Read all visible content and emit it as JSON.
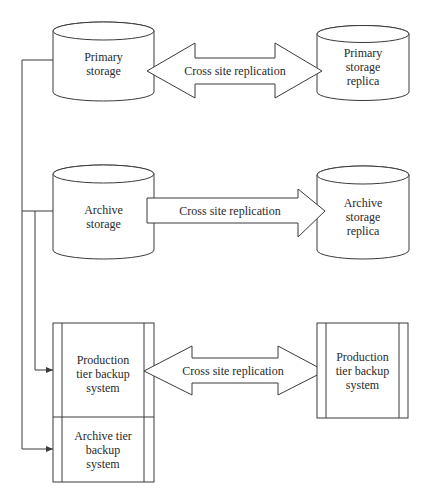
{
  "diagram": {
    "nodes": {
      "primary_storage": {
        "label": "Primary\nstorage",
        "shape": "cylinder"
      },
      "primary_storage_replica": {
        "label": "Primary\nstorage\nreplica",
        "shape": "cylinder"
      },
      "archive_storage": {
        "label": "Archive\nstorage",
        "shape": "cylinder"
      },
      "archive_storage_replica": {
        "label": "Archive\nstorage\nreplica",
        "shape": "cylinder"
      },
      "production_tier_backup": {
        "label": "Production\ntier backup\nsystem",
        "shape": "box"
      },
      "archive_tier_backup": {
        "label": "Archive tier\nbackup\nsystem",
        "shape": "box"
      },
      "production_tier_backup_replica": {
        "label": "Production\ntier backup\nsystem",
        "shape": "box"
      }
    },
    "arrows": {
      "primary_replication": {
        "label": "Cross site replication",
        "direction": "bidirectional"
      },
      "archive_replication": {
        "label": "Cross site replication",
        "direction": "one-way"
      },
      "backup_replication": {
        "label": "Cross site replication",
        "direction": "bidirectional"
      }
    },
    "connectors": [
      {
        "from": "primary_storage",
        "to": "production_tier_backup"
      },
      {
        "from": "primary_storage",
        "to": "archive_tier_backup"
      },
      {
        "from": "archive_storage",
        "to": "production_tier_backup"
      },
      {
        "from": "archive_storage",
        "to": "archive_tier_backup"
      }
    ],
    "colors": {
      "stroke": "#3a3a3a",
      "background": "#ffffff",
      "text": "#2a2a2a"
    }
  }
}
